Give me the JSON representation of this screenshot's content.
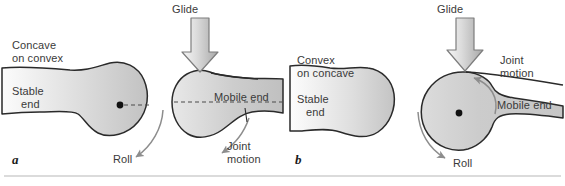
{
  "figure": {
    "type": "anatomy-diagram",
    "background_color": "#ffffff",
    "bone_fill_light": "#fbfbfb",
    "bone_fill_dark": "#c6c6c6",
    "bone_outline_color": "#2a2a2a",
    "arrow_fill_light": "#efefef",
    "arrow_fill_dark": "#b4b4b4",
    "arrow_outline_color": "#7a7a7a",
    "curved_arrow_color": "#8d8d8d",
    "dashed_line_color": "#4a4a4a",
    "text_color": "#3a3a3a",
    "bottom_rule_color": "#cfcfcf"
  },
  "panels": [
    {
      "id": "a",
      "letter": "a",
      "rule_label_line1": "Concave",
      "rule_label_line2": "on convex",
      "stable_label_line1": "Stable",
      "stable_label_line2": "end",
      "mobile_label": "Mobile end",
      "glide_label": "Glide",
      "roll_label": "Roll",
      "joint_motion_line1": "Joint",
      "joint_motion_line2": "motion",
      "stable_end_shape": "convex",
      "mobile_end_shape": "concave",
      "roll_direction": "down-left",
      "joint_motion_direction": "down-left"
    },
    {
      "id": "b",
      "letter": "b",
      "rule_label_line1": "Convex",
      "rule_label_line2": "on concave",
      "stable_label_line1": "Stable",
      "stable_label_line2": "end",
      "mobile_label": "Mobile end",
      "glide_label": "Glide",
      "roll_label": "Roll",
      "joint_motion_line1": "Joint",
      "joint_motion_line2": "motion",
      "stable_end_shape": "concave",
      "mobile_end_shape": "convex",
      "roll_direction": "down-right",
      "joint_motion_direction": "up-left"
    }
  ]
}
